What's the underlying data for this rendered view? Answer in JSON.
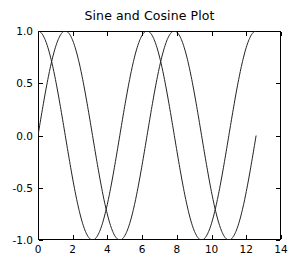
{
  "chart_data": {
    "type": "line",
    "title": "Sine and Cosine Plot",
    "xlabel": "",
    "ylabel": "",
    "xlim": [
      0,
      14
    ],
    "ylim": [
      -1.0,
      1.0
    ],
    "xticks": [
      0,
      2,
      4,
      6,
      8,
      10,
      12,
      14
    ],
    "xticklabels": [
      "0",
      "2",
      "4",
      "6",
      "8",
      "10",
      "12",
      "14"
    ],
    "yticks": [
      -1.0,
      -0.5,
      0.0,
      0.5,
      1.0
    ],
    "yticklabels": [
      "-1.0",
      "-0.5",
      "0.0",
      "0.5",
      "1.0"
    ],
    "grid": false,
    "legend": null,
    "x_data_range": [
      0,
      12.566
    ],
    "series": [
      {
        "name": "sine",
        "function": "sin(x)",
        "color": "#222222",
        "linewidth": 1,
        "x": [
          0,
          0.785,
          1.571,
          2.356,
          3.142,
          3.927,
          4.712,
          5.498,
          6.283,
          7.069,
          7.854,
          8.639,
          9.425,
          10.21,
          10.996,
          11.781,
          12.566
        ],
        "values": [
          0.0,
          0.707,
          1.0,
          0.707,
          0.0,
          -0.707,
          -1.0,
          -0.707,
          0.0,
          0.707,
          1.0,
          0.707,
          0.0,
          -0.707,
          -1.0,
          -0.707,
          0.0
        ]
      },
      {
        "name": "cosine",
        "function": "cos(x)",
        "color": "#222222",
        "linewidth": 1,
        "x": [
          0,
          0.785,
          1.571,
          2.356,
          3.142,
          3.927,
          4.712,
          5.498,
          6.283,
          7.069,
          7.854,
          8.639,
          9.425,
          10.21,
          10.996,
          11.781,
          12.566
        ],
        "values": [
          1.0,
          0.707,
          0.0,
          -0.707,
          -1.0,
          -0.707,
          0.0,
          0.707,
          1.0,
          0.707,
          0.0,
          -0.707,
          -1.0,
          -0.707,
          0.0,
          0.707,
          1.0
        ]
      }
    ]
  },
  "axes": {
    "title": "Sine and Cosine Plot"
  }
}
